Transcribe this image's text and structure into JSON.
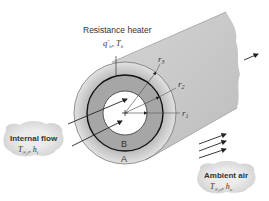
{
  "diagram": {
    "heater": {
      "label": "Resistance heater",
      "params": "q″h, Th"
    },
    "radii": {
      "r1": "r1",
      "r2": "r2",
      "r3": "r3"
    },
    "regions": {
      "inner_layer": "B",
      "outer_layer": "A"
    },
    "internal_flow": {
      "title": "Internal flow",
      "params": "T∞,i, hi"
    },
    "ambient_air": {
      "title": "Ambient air",
      "params": "T∞,o, ho"
    },
    "colors": {
      "cylinder_fill": "#c8c8c8",
      "layer_b": "#a8a8a8",
      "layer_a_edge": "#d8d8d8",
      "bore": "#ffffff",
      "line": "#222222",
      "cloud": "#dcdcdc"
    }
  }
}
